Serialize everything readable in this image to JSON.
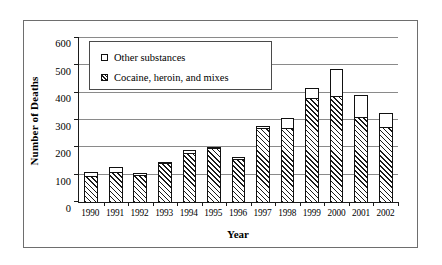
{
  "chart_data": {
    "type": "bar",
    "subtype": "stacked-vertical",
    "title": "",
    "xlabel": "Year",
    "ylabel": "Number of Deaths",
    "ylim": [
      0,
      600
    ],
    "ytick_step": 100,
    "yticks": [
      0,
      100,
      200,
      300,
      400,
      500,
      600
    ],
    "ytick_labels": [
      "0",
      "100",
      "200",
      "300",
      "400",
      "500",
      "600"
    ],
    "grid": "horizontal",
    "legend_position": "upper-left-inside",
    "categories": [
      "1990",
      "1991",
      "1992",
      "1993",
      "1994",
      "1995",
      "1996",
      "1997",
      "1998",
      "1999",
      "2000",
      "2001",
      "2002"
    ],
    "series": [
      {
        "name": "Cocaine, heroin, and mixes",
        "fill": "diagonal-hatch",
        "values": [
          95,
          110,
          100,
          142,
          178,
          198,
          155,
          270,
          268,
          380,
          385,
          310,
          273
        ]
      },
      {
        "name": "Other substances",
        "fill": "white",
        "values": [
          13,
          18,
          7,
          3,
          10,
          2,
          10,
          5,
          37,
          35,
          98,
          80,
          49
        ]
      }
    ],
    "totals": [
      108,
      128,
      107,
      145,
      188,
      200,
      165,
      275,
      305,
      415,
      483,
      390,
      322
    ]
  },
  "legend": {
    "entries": [
      {
        "label": "Other substances",
        "swatch": "white-square"
      },
      {
        "label": "Cocaine, heroin, and mixes",
        "swatch": "hatched-square"
      }
    ]
  },
  "axes": {
    "y_title": "Number of Deaths",
    "x_title": "Year"
  },
  "colors": {
    "ink": "#111111",
    "gridline": "#8a8a8a",
    "frame": "#6e6e6e",
    "background": "#ffffff"
  }
}
